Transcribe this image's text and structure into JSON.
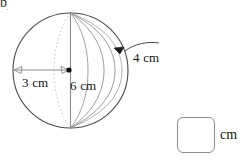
{
  "page": {
    "corner_mark": "b)",
    "background_color": "#ffffff",
    "width": 250,
    "height": 165
  },
  "figure": {
    "shape_name": "sphere",
    "outline_color": "#4a4a4a",
    "meridian_color": "#8a8a8a",
    "dimension_line_color": "#7d7d7d",
    "center_dot_color": "#111111",
    "circle": {
      "cx": 70.5,
      "cy": 70.5,
      "r": 57.5
    },
    "center_dot": {
      "cx": 69,
      "cy": 70,
      "r": 2.6
    },
    "labels": [
      {
        "name": "radius-label",
        "text": "3 cm",
        "value": 3,
        "unit": "cm"
      },
      {
        "name": "diameter-label",
        "text": "6 cm",
        "value": 6,
        "unit": "cm"
      },
      {
        "name": "arc-label",
        "text": "4 cm",
        "value": 4,
        "unit": "cm"
      }
    ]
  },
  "answer": {
    "value": "",
    "placeholder": "",
    "unit_label": "cm"
  }
}
